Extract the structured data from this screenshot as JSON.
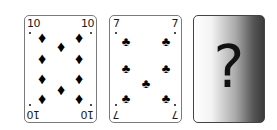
{
  "cards": [
    {
      "rank": "10",
      "suit": "diamonds",
      "suit_symbol": "♦",
      "face_up": true
    },
    {
      "rank": "7",
      "suit": "clubs",
      "suit_symbol": "♣",
      "face_up": true
    },
    {
      "rank": "",
      "suit": "",
      "face_up": false,
      "label": "?"
    }
  ],
  "colors": {
    "card_border": "#7a7a7a",
    "pip": "#000000",
    "mystery_gradient_start": "#ffffff",
    "mystery_gradient_end": "#3a3a3a"
  }
}
